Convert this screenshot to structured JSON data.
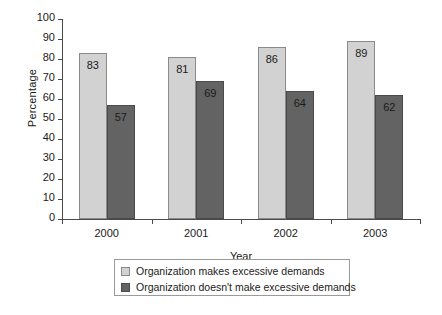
{
  "chart_data": {
    "type": "bar",
    "title": "",
    "xlabel": "Year",
    "ylabel": "Percentage",
    "categories": [
      "2000",
      "2001",
      "2002",
      "2003"
    ],
    "series": [
      {
        "name": "Organization makes excessive demands",
        "color": "#d2d2d2",
        "values": [
          83,
          81,
          86,
          89
        ]
      },
      {
        "name": "Organization doesn't make excessive demands",
        "color": "#636363",
        "values": [
          57,
          69,
          64,
          62
        ]
      }
    ],
    "ylim": [
      0,
      100
    ],
    "ytick_step": 10,
    "ytick_labels": [
      "0",
      "10",
      "20",
      "30",
      "40",
      "50",
      "60",
      "70",
      "80",
      "90",
      "100"
    ],
    "grid": false,
    "legend_position": "bottom-center",
    "data_labels": true
  },
  "axes": {
    "y_title": "Percentage",
    "x_title": "Year"
  },
  "legend": {
    "items": [
      {
        "label": "Organization makes excessive demands",
        "color": "#d2d2d2"
      },
      {
        "label": "Organization doesn't make excessive demands",
        "color": "#636363"
      }
    ]
  },
  "colors": {
    "series_light": "#d2d2d2",
    "series_dark": "#636363",
    "axis": "#4a4a4a",
    "text": "#1a1a1a",
    "background": "#ffffff"
  }
}
